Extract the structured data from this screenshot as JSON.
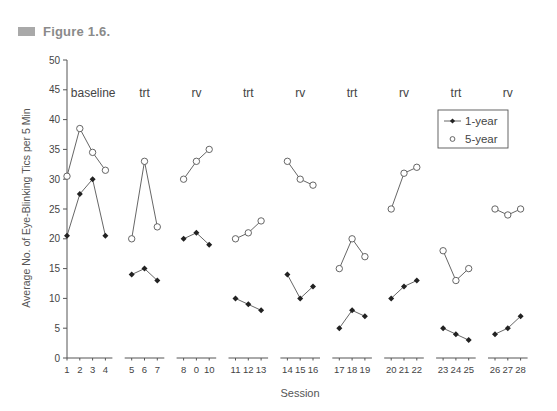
{
  "figure": {
    "label": "Figure 1.6."
  },
  "chart_data": {
    "type": "line",
    "title": "",
    "xlabel": "Session",
    "ylabel": "Average No. of Eye-Blinking Tics per 5 Min",
    "ylim": [
      0,
      50
    ],
    "yticks": [
      0,
      5,
      10,
      15,
      20,
      25,
      30,
      35,
      40,
      45,
      50
    ],
    "grid": false,
    "legend_position": "upper right",
    "x_tick_labels": [
      "1",
      "2",
      "3",
      "4",
      "5",
      "6",
      "7",
      "8",
      "0",
      "10",
      "11",
      "12",
      "13",
      "14",
      "15",
      "16",
      "17",
      "18",
      "19",
      "20",
      "21",
      "22",
      "23",
      "24",
      "25",
      "26",
      "27",
      "28"
    ],
    "phases": [
      {
        "label": "baseline",
        "sessions": [
          1,
          2,
          3,
          4
        ]
      },
      {
        "label": "trt",
        "sessions": [
          5,
          6,
          7
        ]
      },
      {
        "label": "rv",
        "sessions": [
          8,
          9,
          10
        ]
      },
      {
        "label": "trt",
        "sessions": [
          11,
          12,
          13
        ]
      },
      {
        "label": "rv",
        "sessions": [
          14,
          15,
          16
        ]
      },
      {
        "label": "trt",
        "sessions": [
          17,
          18,
          19
        ]
      },
      {
        "label": "rv",
        "sessions": [
          20,
          21,
          22
        ]
      },
      {
        "label": "trt",
        "sessions": [
          23,
          24,
          25
        ]
      },
      {
        "label": "rv",
        "sessions": [
          26,
          27,
          28
        ]
      }
    ],
    "x": [
      1,
      2,
      3,
      4,
      5,
      6,
      7,
      8,
      9,
      10,
      11,
      12,
      13,
      14,
      15,
      16,
      17,
      18,
      19,
      20,
      21,
      22,
      23,
      24,
      25,
      26,
      27,
      28
    ],
    "series": [
      {
        "name": "1-year",
        "marker": "filled-diamond",
        "values": [
          20.5,
          27.5,
          30,
          20.5,
          14,
          15,
          13,
          20,
          21,
          19,
          10,
          9,
          8,
          14,
          10,
          12,
          5,
          8,
          7,
          10,
          12,
          13,
          5,
          4,
          3,
          4,
          5,
          7
        ]
      },
      {
        "name": "5-year",
        "marker": "open-circle",
        "values": [
          30.5,
          38.5,
          34.5,
          31.5,
          20,
          33,
          22,
          30,
          33,
          35,
          20,
          21,
          23,
          33,
          30,
          29,
          15,
          20,
          17,
          25,
          31,
          32,
          18,
          13,
          15,
          25,
          24,
          25
        ]
      }
    ]
  },
  "colors": {
    "line": "#555555",
    "marker_fill": "#222222",
    "axis": "#555555",
    "text": "#444444",
    "header_square": "#a9a9a9",
    "header_text": "#8a8a8a"
  }
}
